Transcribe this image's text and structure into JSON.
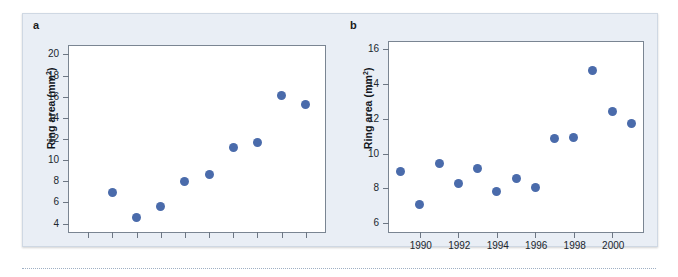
{
  "figure": {
    "background_color": "#e9eef5",
    "marker_color": "#4a6bab",
    "axis_color": "#7a8592"
  },
  "panels": [
    {
      "letter": "a",
      "ylabel_text": "Ring area (mm",
      "ylabel_sup": "2",
      "ylabel_close": ")"
    },
    {
      "letter": "b",
      "ylabel_text": "Ring area (mm",
      "ylabel_sup": "2",
      "ylabel_close": ")"
    }
  ],
  "chart_data": [
    {
      "type": "scatter",
      "panel": "a",
      "title": "",
      "xlabel": "",
      "ylabel": "Ring area (mm²)",
      "ylim": [
        3.2,
        20.8
      ],
      "yticks": [
        4,
        6,
        8,
        10,
        12,
        14,
        16,
        18,
        20
      ],
      "ytick_labels": [
        "4",
        "6",
        "8",
        "10",
        "12",
        "14",
        "16",
        "18",
        "20"
      ],
      "xlim": [
        0.2,
        10.8
      ],
      "xticks": [
        1,
        2,
        3,
        4,
        5,
        6,
        7,
        8,
        9,
        10
      ],
      "xtick_labels": [
        "",
        "",
        "",
        "",
        "",
        "",
        "",
        "",
        "",
        ""
      ],
      "grid": false,
      "legend": "none",
      "x": [
        2,
        3,
        4,
        5,
        6,
        7,
        8,
        9,
        10
      ],
      "values": [
        6.9,
        4.6,
        5.6,
        7.95,
        8.65,
        11.15,
        11.65,
        16.1,
        15.25
      ]
    },
    {
      "type": "scatter",
      "panel": "b",
      "title": "",
      "xlabel": "",
      "ylabel": "Ring area (mm²)",
      "ylim": [
        5.5,
        16.4
      ],
      "yticks": [
        6,
        8,
        10,
        12,
        14,
        16
      ],
      "ytick_labels": [
        "6",
        "8",
        "10",
        "12",
        "14",
        "16"
      ],
      "xlim": [
        1988.4,
        2001.6
      ],
      "xticks": [
        1990,
        1992,
        1994,
        1996,
        1998,
        2000
      ],
      "xtick_labels": [
        "1990",
        "1992",
        "1994",
        "1996",
        "1998",
        "2000"
      ],
      "grid": false,
      "legend": "none",
      "x": [
        1989,
        1990,
        1991,
        1992,
        1993,
        1994,
        1995,
        1996,
        1997,
        1998,
        1999,
        2000,
        2001
      ],
      "values": [
        8.95,
        7.05,
        9.45,
        8.3,
        9.15,
        7.8,
        8.55,
        8.05,
        10.85,
        10.95,
        14.75,
        12.4,
        11.75
      ]
    }
  ]
}
